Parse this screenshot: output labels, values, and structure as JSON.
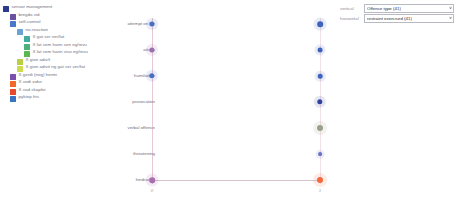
{
  "legend": {
    "items": [
      {
        "label": "sensor management",
        "color": "#2b3a8f",
        "depth": 0
      },
      {
        "label": "bregda vid",
        "color": "#6b4fa0",
        "depth": 1
      },
      {
        "label": "self-control",
        "color": "#4a78c8",
        "depth": 1
      },
      {
        "label": "no-reaction",
        "color": "#6aa3d8",
        "depth": 2
      },
      {
        "label": "X gat ser ver/fat",
        "color": "#3fae9e",
        "depth": 3
      },
      {
        "label": "X lat sem hann sen eg/tevu",
        "color": "#4bb07a",
        "depth": 3
      },
      {
        "label": "X lat sem hann viso eg/tevu",
        "color": "#5ab84e",
        "depth": 3
      },
      {
        "label": "X gion adiv/t",
        "color": "#b9cf45",
        "depth": 2
      },
      {
        "label": "X gion adivit ng gat ser ver/fat",
        "color": "#cddb4e",
        "depth": 2
      },
      {
        "label": "X gerdi (nog) hermi",
        "color": "#7b4fae",
        "depth": 1
      },
      {
        "label": "X vodi vidur",
        "color": "#ef6a2a",
        "depth": 1
      },
      {
        "label": "X vad skapfoi",
        "color": "#e8482c",
        "depth": 1
      },
      {
        "label": "pyktep fris",
        "color": "#3a72c4",
        "depth": 1
      }
    ]
  },
  "controls": {
    "vertical": {
      "label": "vertical",
      "value": "Offence type (41)"
    },
    "horizontal": {
      "label": "horizontal",
      "value": "restraint exercised (41)"
    },
    "caret": "∨"
  },
  "chart_data": {
    "type": "scatter",
    "title": "",
    "xlabel": "",
    "ylabel": "",
    "categories": [
      "attempt on life",
      "attack",
      "humiliation",
      "provocation",
      "verbal offence",
      "threatening",
      "hindrance"
    ],
    "x_ticks": [
      {
        "label": "0",
        "x": 52
      },
      {
        "label": "1",
        "x": 220
      }
    ],
    "series": [
      {
        "name": "left-column",
        "points": [
          {
            "category": "attempt on life",
            "x": 52,
            "size": 5.2,
            "color": "#4a6fc0"
          },
          {
            "category": "attack",
            "x": 52,
            "size": 5.2,
            "color": "#9b6fae"
          },
          {
            "category": "humiliation",
            "x": 52,
            "size": 5.4,
            "color": "#4a6fc0"
          },
          {
            "category": "hindrance",
            "x": 52,
            "size": 5.6,
            "color": "#a86fae"
          }
        ]
      },
      {
        "name": "right-column",
        "points": [
          {
            "category": "attempt on life",
            "x": 220,
            "size": 5.6,
            "color": "#3f62bd"
          },
          {
            "category": "attack",
            "x": 220,
            "size": 4.8,
            "color": "#3f62bd"
          },
          {
            "category": "humiliation",
            "x": 220,
            "size": 4.6,
            "color": "#3f62bd"
          },
          {
            "category": "provocation",
            "x": 220,
            "size": 5.4,
            "color": "#31419e"
          },
          {
            "category": "verbal offence",
            "x": 220,
            "size": 6.0,
            "color": "#9aa08a"
          },
          {
            "category": "threatening",
            "x": 220,
            "size": 3.8,
            "color": "#6a72c4"
          },
          {
            "category": "hindrance",
            "x": 220,
            "size": 6.0,
            "color": "#ef6a3e"
          }
        ]
      }
    ],
    "connectors": [
      {
        "category": "hindrance",
        "x1": 52,
        "x2": 220,
        "color": "#d9c2cc"
      }
    ],
    "grid": false,
    "legend_position": "left"
  }
}
